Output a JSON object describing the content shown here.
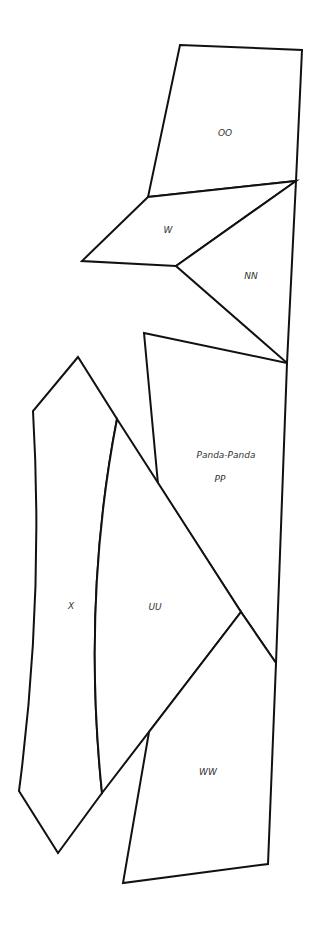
{
  "diagram": {
    "type": "labeled-polygon-map",
    "stroke_color": "#111111",
    "fill_color": "#ffffff",
    "regions": [
      {
        "id": "OO",
        "label": "OO"
      },
      {
        "id": "W",
        "label": "W"
      },
      {
        "id": "NN",
        "label": "NN"
      },
      {
        "id": "PP",
        "label": "PP",
        "name": "Panda-Panda"
      },
      {
        "id": "X",
        "label": "X"
      },
      {
        "id": "UU",
        "label": "UU"
      },
      {
        "id": "WW",
        "label": "WW"
      }
    ]
  }
}
